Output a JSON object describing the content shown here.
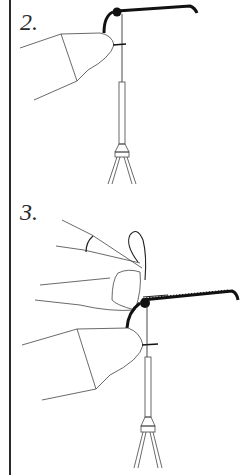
{
  "diagram": {
    "steps": [
      {
        "label": "2.",
        "description": "fingers holding thread at hook, thread hanging to bobbin"
      },
      {
        "label": "3.",
        "description": "second finger pinching loop over hook with thread wrapped hook shank, bobbin below"
      }
    ],
    "colors": {
      "line": "#2a2a2a",
      "ink": "#111111",
      "background": "#ffffff"
    }
  }
}
